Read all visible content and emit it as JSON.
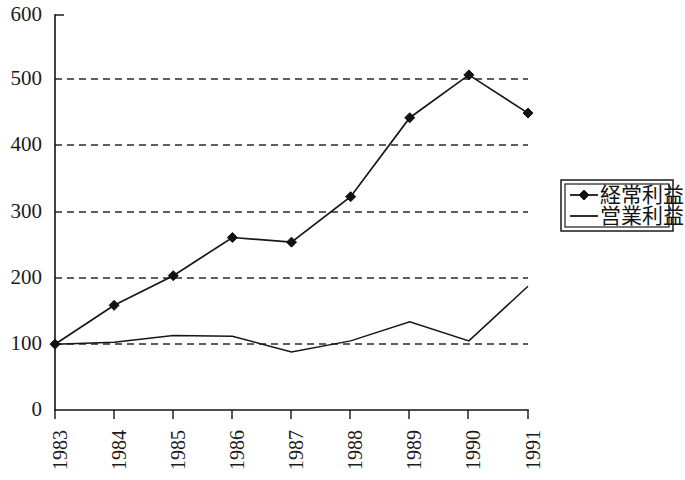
{
  "chart_data": {
    "type": "line",
    "title": "",
    "subtitle": "",
    "xlabel": "",
    "ylabel": "",
    "categories": [
      "1983",
      "1984",
      "1985",
      "1986",
      "1987",
      "1988",
      "1989",
      "1990",
      "1991"
    ],
    "series": [
      {
        "name": "経常利益",
        "marker": "diamond",
        "values": [
          100,
          159,
          204,
          262,
          255,
          324,
          444,
          509,
          451
        ]
      },
      {
        "name": "営業利益",
        "marker": "none",
        "values": [
          100,
          103,
          113,
          112,
          88,
          105,
          134,
          105,
          188
        ]
      }
    ],
    "ylim": [
      0,
      600
    ],
    "yticks": [
      0,
      100,
      200,
      300,
      400,
      500,
      600
    ],
    "ytick_labels": [
      "0",
      "100",
      "200",
      "300",
      "400",
      "500",
      "600"
    ],
    "gridlines_at": [
      100,
      200,
      300,
      400,
      500
    ],
    "grid": "horizontal-dashed",
    "legend_position": "right-middle",
    "xtick_rotation": 90,
    "colors": {
      "line": "#161616",
      "grid": "#2b2b2b",
      "axis": "#141414",
      "background": "#ffffff"
    }
  },
  "legend": {
    "entries": [
      {
        "label": "経常利益",
        "style": "line-with-diamond-marker"
      },
      {
        "label": "営業利益",
        "style": "plain-line"
      }
    ]
  },
  "axes": {
    "y": {
      "labels": [
        "600",
        "500",
        "400",
        "300",
        "200",
        "100",
        "0"
      ]
    },
    "x": {
      "labels": [
        "1983",
        "1984",
        "1985",
        "1986",
        "1987",
        "1988",
        "1989",
        "1990",
        "1991"
      ]
    }
  }
}
